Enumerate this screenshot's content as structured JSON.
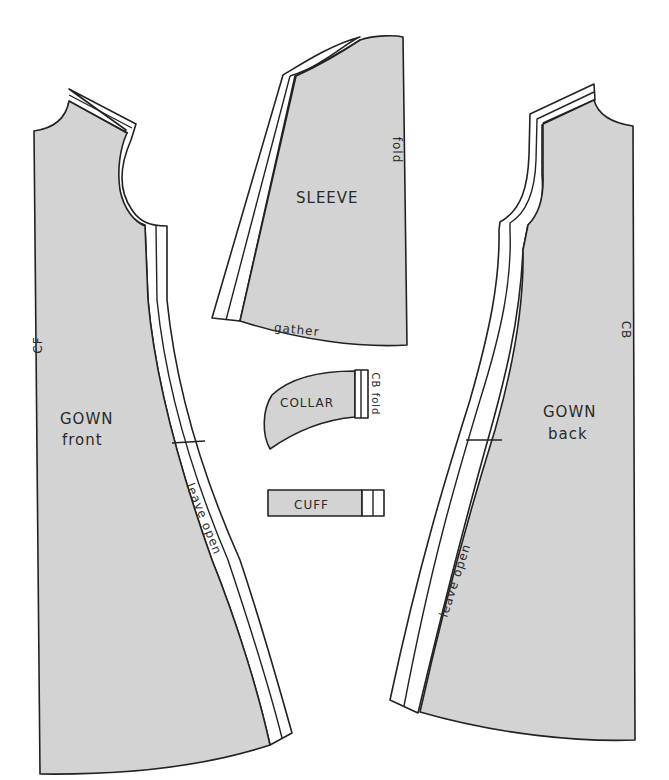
{
  "diagram": {
    "type": "sewing pattern layout",
    "fill_color": "#d3d3d3",
    "line_color": "#222222",
    "pieces": [
      {
        "id": "gown-front",
        "title": "GOWN",
        "subtitle": "front",
        "marks": {
          "center": "CF",
          "side_note": "leave open"
        }
      },
      {
        "id": "sleeve",
        "title": "SLEEVE",
        "marks": {
          "edge": "fold",
          "bottom": "gather"
        }
      },
      {
        "id": "collar",
        "title": "COLLAR",
        "marks": {
          "edge": "CB fold"
        }
      },
      {
        "id": "cuff",
        "title": "CUFF"
      },
      {
        "id": "gown-back",
        "title": "GOWN",
        "subtitle": "back",
        "marks": {
          "center": "CB",
          "side_note": "leave open"
        }
      }
    ]
  }
}
